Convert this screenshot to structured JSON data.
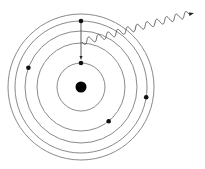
{
  "diagram": {
    "orbit_count": 5,
    "nucleus": {
      "label": "nucleus"
    },
    "electrons": [
      {
        "orbit": 4,
        "angle_deg": -90,
        "role": "transitioning-electron-initial"
      },
      {
        "orbit": 1,
        "angle_deg": -90,
        "role": "transitioning-electron-final"
      },
      {
        "orbit": 3,
        "angle_deg": 200
      },
      {
        "orbit": 2,
        "angle_deg": 51
      },
      {
        "orbit": 4,
        "angle_deg": 9
      }
    ],
    "transition": {
      "from_orbit": 4,
      "to_orbit": 1,
      "direction": "inward"
    },
    "photon": {
      "label": "emitted photon",
      "direction": "up-right"
    },
    "colors": {
      "orbit": "#8a8a8a",
      "electron": "#111111",
      "nucleus": "#000000",
      "photon": "#555555"
    }
  }
}
